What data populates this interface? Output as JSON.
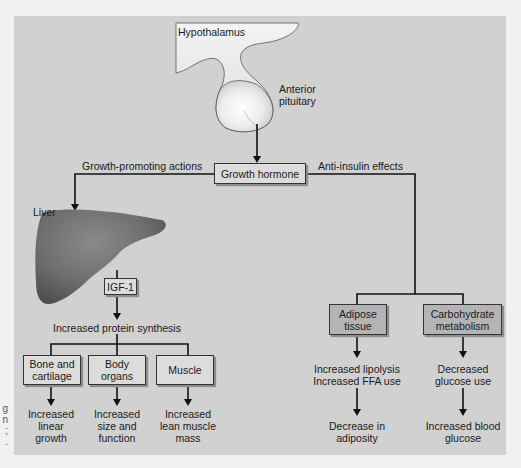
{
  "figure": {
    "top": {
      "hypothalamus_label": "Hypothalamus",
      "pituitary_label_line1": "Anterior",
      "pituitary_label_line2": "pituitary",
      "liver_label": "Liver"
    },
    "growth_hormone_box": "Growth hormone",
    "branches": {
      "left_label": "Growth-promoting actions",
      "right_label": "Anti-insulin effects"
    },
    "left": {
      "igf_box": "IGF-1",
      "protein_synthesis": "Increased protein synthesis",
      "targets": [
        {
          "box_line1": "Bone and",
          "box_line2": "cartilage",
          "outcome_line1": "Increased",
          "outcome_line2": "linear",
          "outcome_line3": "growth"
        },
        {
          "box_line1": "Body",
          "box_line2": "organs",
          "outcome_line1": "Increased",
          "outcome_line2": "size and",
          "outcome_line3": "function"
        },
        {
          "box_line1": "Muscle",
          "box_line2": "",
          "outcome_line1": "Increased",
          "outcome_line2": "lean muscle",
          "outcome_line3": "mass"
        }
      ]
    },
    "right": {
      "targets": [
        {
          "box_line1": "Adipose",
          "box_line2": "tissue",
          "effect_line1": "Increased lipolysis",
          "effect_line2": "Increased FFA use",
          "outcome_line1": "Decrease in",
          "outcome_line2": "adiposity"
        },
        {
          "box_line1": "Carbohydrate",
          "box_line2": "metabolism",
          "effect_line1": "Decreased",
          "effect_line2": "glucose use",
          "outcome_line1": "Increased blood",
          "outcome_line2": "glucose"
        }
      ]
    },
    "edge_fragment": {
      "line1": "g",
      "line2": "n",
      "line3": ";",
      "line4": "."
    }
  },
  "colors": {
    "page_bg": "#f1f1f1",
    "panel_bg": "#d1d1d1",
    "box_light": "#dcdcdc",
    "box_dark": "#b4b4b4",
    "line": "#111111"
  }
}
